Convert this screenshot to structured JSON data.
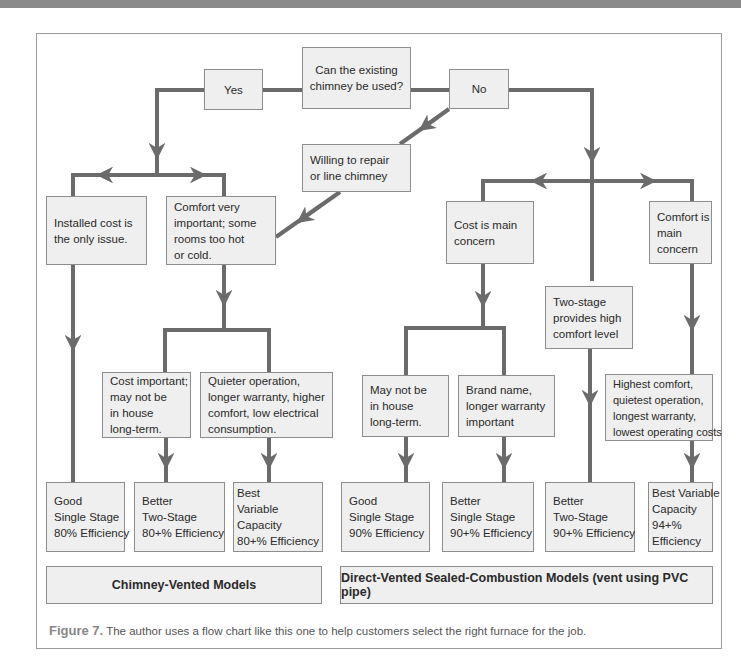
{
  "colors": {
    "line": "#6b6b6b",
    "box_fill": "#efefef",
    "box_border": "#8d8d8d",
    "top_band": "#8a8a8a"
  },
  "flowchart": {
    "question": [
      "Can the existing",
      "chimney be used?"
    ],
    "yes": "Yes",
    "no": "No",
    "willing": [
      "Willing to repair",
      "or line chimney"
    ],
    "installed_cost": [
      "Installed cost is",
      "the only issue."
    ],
    "comfort_very": [
      "Comfort  very",
      "important; some",
      "rooms too hot",
      "or cold."
    ],
    "cost_important": [
      "Cost important;",
      "may not be",
      "in house",
      "long-term."
    ],
    "quieter": [
      "Quieter operation,",
      "longer warranty, higher",
      "comfort, low electrical",
      "consumption."
    ],
    "cost_main": [
      "Cost is main",
      "concern"
    ],
    "two_stage_provides": [
      "Two-stage",
      "provides high",
      "comfort level"
    ],
    "comfort_main": [
      "Comfort is",
      "main",
      "concern"
    ],
    "may_not": [
      "May not be",
      "in house",
      "long-term."
    ],
    "brand_name": [
      "Brand name,",
      "longer warranty",
      "important"
    ],
    "highest_comfort": [
      "Highest comfort,",
      "quietest operation,",
      "longest warranty,",
      "lowest operating costs"
    ],
    "results": [
      [
        "Good",
        "Single Stage",
        "80% Efficiency"
      ],
      [
        "Better",
        "Two-Stage",
        "80+% Efficiency"
      ],
      [
        "Best",
        "Variable",
        "Capacity",
        "80+% Efficiency"
      ],
      [
        "Good",
        "Single Stage",
        "90% Efficiency"
      ],
      [
        "Better",
        "Single Stage",
        "90+% Efficiency"
      ],
      [
        "Better",
        "Two-Stage",
        "90+% Efficiency"
      ],
      [
        "Best Variable",
        "Capacity",
        "94+%",
        "Efficiency"
      ]
    ],
    "footers": {
      "chimney": "Chimney-Vented Models",
      "direct": "Direct-Vented Sealed-Combustion Models (vent using PVC pipe)"
    }
  },
  "caption": {
    "label": "Figure 7.",
    "text": " The author uses a flow chart like this one to help customers select the right furnace for the job."
  }
}
